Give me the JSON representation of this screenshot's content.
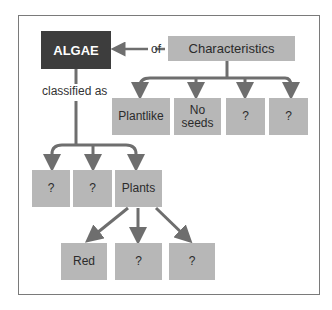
{
  "diagram": {
    "root": {
      "label": "ALGAE"
    },
    "characteristics": {
      "label": "Characteristics",
      "connector": "of"
    },
    "classified_connector": "classified as",
    "characteristic_items": [
      "Plantlike",
      "No\nseeds",
      "?",
      "?"
    ],
    "classifications": [
      "?",
      "?",
      "Plants"
    ],
    "plant_types": [
      "Red",
      "?",
      "?"
    ],
    "colors": {
      "dark_box": "#3d3d3d",
      "box": "#b7b7b7",
      "arrow": "#6e6e6e",
      "frame": "#7a7a7a"
    }
  }
}
